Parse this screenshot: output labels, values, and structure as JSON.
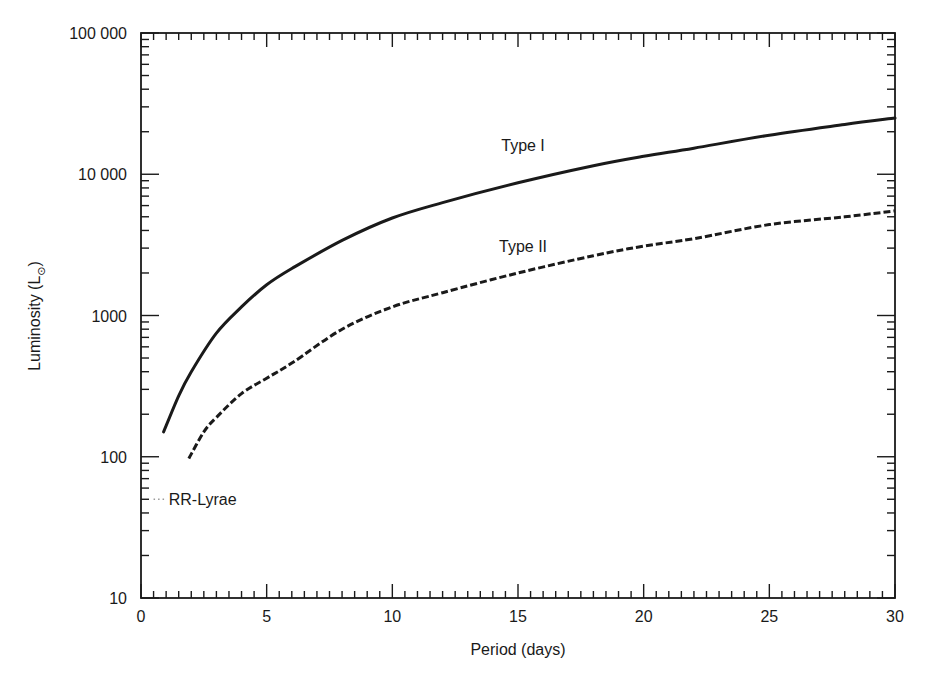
{
  "chart_data": {
    "type": "line",
    "title": "",
    "xlabel": "Period (days)",
    "ylabel": "Luminosity (L",
    "ylabel_sub": "⊙",
    "ylabel_close": ")",
    "xlim": [
      0,
      30
    ],
    "ylim": [
      10,
      100000
    ],
    "yscale": "log",
    "grid": false,
    "legend_position": "inline labels on curves",
    "x_ticks": [
      0,
      5,
      10,
      15,
      20,
      25,
      30
    ],
    "x_tick_labels": [
      "0",
      "5",
      "10",
      "15",
      "20",
      "25",
      "30"
    ],
    "x_minor_step": 0.5,
    "y_ticks": [
      10,
      100,
      1000,
      10000,
      100000
    ],
    "y_tick_labels": [
      "10",
      "100",
      "1000",
      "10 000",
      "100 000"
    ],
    "series": [
      {
        "name": "Type I",
        "style": "solid",
        "x": [
          0.9,
          1.5,
          2,
          3,
          4,
          5,
          6,
          8,
          10,
          12,
          15,
          18,
          20,
          22,
          25,
          28,
          30
        ],
        "values": [
          150,
          270,
          400,
          750,
          1150,
          1650,
          2150,
          3400,
          4900,
          6300,
          8700,
          11500,
          13400,
          15300,
          18900,
          22500,
          25000
        ]
      },
      {
        "name": "Type II",
        "style": "dashed",
        "x": [
          1.9,
          2.5,
          3,
          4,
          5,
          6,
          8,
          10,
          12,
          15,
          18,
          20,
          22,
          25,
          28,
          30
        ],
        "values": [
          97,
          150,
          190,
          280,
          360,
          460,
          800,
          1150,
          1450,
          2000,
          2650,
          3100,
          3500,
          4400,
          5000,
          5500
        ]
      }
    ],
    "annotations": [
      {
        "text": "Type I",
        "x": 15.2,
        "y": 14500,
        "target_series": "Type I"
      },
      {
        "text": "Type II",
        "x": 15.2,
        "y": 2800,
        "target_series": "Type II"
      },
      {
        "text": "RR-Lyrae",
        "x": 1.5,
        "y": 50,
        "marker": "dotted",
        "marker_x": [
          0.5,
          1.0
        ],
        "marker_y": 50
      }
    ]
  }
}
